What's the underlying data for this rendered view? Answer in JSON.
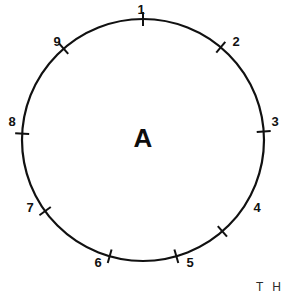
{
  "figure": {
    "type": "circle-diagram",
    "center_label": "A",
    "background_color": "#ffffff",
    "stroke_color": "#111111",
    "circle": {
      "center_x": 143,
      "center_y": 140,
      "radius": 121,
      "stroke_width": 2.2
    },
    "ticks": [
      {
        "label": "1",
        "angle_deg": 90,
        "label_x": 141,
        "label_y": 11,
        "anchor": "middle"
      },
      {
        "label": "2",
        "angle_deg": 50,
        "label_x": 236,
        "label_y": 43,
        "anchor": "middle"
      },
      {
        "label": "3",
        "angle_deg": 4,
        "label_x": 275,
        "label_y": 123,
        "anchor": "middle"
      },
      {
        "label": "4",
        "angle_deg": -49,
        "label_x": 257,
        "label_y": 209,
        "anchor": "middle"
      },
      {
        "label": "5",
        "angle_deg": -74,
        "label_x": 190,
        "label_y": 264,
        "anchor": "middle"
      },
      {
        "label": "6",
        "angle_deg": -106,
        "label_x": 98,
        "label_y": 264,
        "anchor": "middle"
      },
      {
        "label": "7",
        "angle_deg": -144,
        "label_x": 30,
        "label_y": 209,
        "anchor": "middle"
      },
      {
        "label": "8",
        "angle_deg": 177,
        "label_x": 12,
        "label_y": 123,
        "anchor": "middle"
      },
      {
        "label": "9",
        "angle_deg": 131,
        "label_x": 57,
        "label_y": 43,
        "anchor": "middle"
      }
    ],
    "tick_mark": {
      "inner_offset": 7,
      "outer_offset": 7,
      "stroke_width": 2.0
    },
    "edge_text": "T H"
  }
}
